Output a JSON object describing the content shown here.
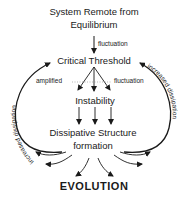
{
  "diagram": {
    "nodes": {
      "system": [
        "System Remote from",
        "Equilibrium"
      ],
      "threshold": "Critical Threshold",
      "instability": "Instability",
      "dissipative": [
        "Dissipative Structure",
        "formation"
      ],
      "evolution": "EVOLUTION"
    },
    "edge_labels": {
      "fluctuation_top": "fluctuation",
      "amplified": "amplified",
      "fluctuation_side": "fluctuation"
    },
    "loop_labels": {
      "left": "increased dissipation",
      "right": "increased dissipation"
    },
    "edges": [
      {
        "from": "system",
        "to": "threshold",
        "label": "fluctuation"
      },
      {
        "from": "threshold",
        "to": "instability",
        "count": 3,
        "label": "amplified fluctuation"
      },
      {
        "from": "instability",
        "to": "dissipative",
        "count": 3
      },
      {
        "from": "dissipative",
        "to": "threshold",
        "side": "left",
        "label": "increased dissipation"
      },
      {
        "from": "dissipative",
        "to": "threshold",
        "side": "right",
        "label": "increased dissipation"
      },
      {
        "from": "dissipative",
        "to": "evolution",
        "count": 6
      }
    ]
  }
}
